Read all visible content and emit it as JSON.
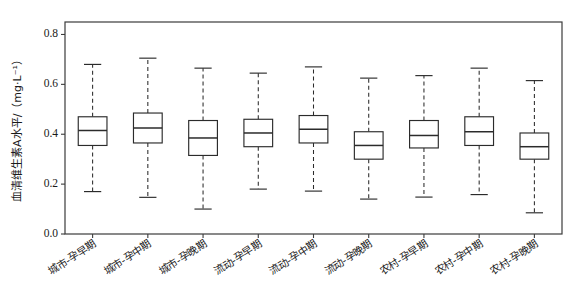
{
  "chart_data": {
    "type": "box",
    "title": "",
    "xlabel": "",
    "ylabel": "血清维生素A水平/（mg·L⁻¹）",
    "ylim": [
      0.0,
      0.85
    ],
    "ytick_labels": [
      "0.0",
      "0.2",
      "0.4",
      "0.6",
      "0.8"
    ],
    "ytick_values": [
      0.0,
      0.2,
      0.4,
      0.6,
      0.8
    ],
    "grid": false,
    "legend": null,
    "categories": [
      "城市-孕早期",
      "城市-孕中期",
      "城市-孕晚期",
      "流动-孕早期",
      "流动-孕中期",
      "流动-孕晚期",
      "农村-孕早期",
      "农村-孕中期",
      "农村-孕晚期"
    ],
    "boxes": [
      {
        "category": "城市-孕早期",
        "whisker_low": 0.17,
        "q1": 0.355,
        "median": 0.415,
        "q3": 0.47,
        "whisker_high": 0.68
      },
      {
        "category": "城市-孕中期",
        "whisker_low": 0.147,
        "q1": 0.365,
        "median": 0.425,
        "q3": 0.485,
        "whisker_high": 0.705
      },
      {
        "category": "城市-孕晚期",
        "whisker_low": 0.1,
        "q1": 0.315,
        "median": 0.385,
        "q3": 0.455,
        "whisker_high": 0.665
      },
      {
        "category": "流动-孕早期",
        "whisker_low": 0.18,
        "q1": 0.35,
        "median": 0.405,
        "q3": 0.46,
        "whisker_high": 0.645
      },
      {
        "category": "流动-孕中期",
        "whisker_low": 0.172,
        "q1": 0.365,
        "median": 0.42,
        "q3": 0.475,
        "whisker_high": 0.67
      },
      {
        "category": "流动-孕晚期",
        "whisker_low": 0.14,
        "q1": 0.3,
        "median": 0.355,
        "q3": 0.41,
        "whisker_high": 0.625
      },
      {
        "category": "农村-孕早期",
        "whisker_low": 0.148,
        "q1": 0.345,
        "median": 0.395,
        "q3": 0.455,
        "whisker_high": 0.635
      },
      {
        "category": "农村-孕中期",
        "whisker_low": 0.158,
        "q1": 0.355,
        "median": 0.41,
        "q3": 0.47,
        "whisker_high": 0.665
      },
      {
        "category": "农村-孕晚期",
        "whisker_low": 0.085,
        "q1": 0.3,
        "median": 0.35,
        "q3": 0.405,
        "whisker_high": 0.615
      }
    ]
  }
}
